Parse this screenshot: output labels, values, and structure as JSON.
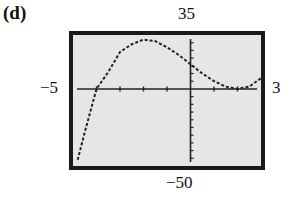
{
  "panel": {
    "label": "(d)"
  },
  "chart_data": {
    "type": "line",
    "title": "(d)",
    "xlabel": "",
    "ylabel": "",
    "xlim": [
      -5,
      3
    ],
    "ylim": [
      -50,
      35
    ],
    "tick_labels": {
      "xmin": "−5",
      "xmax": "3",
      "ymin": "−50",
      "ymax": "35"
    },
    "grid": false,
    "series": [
      {
        "name": "curve",
        "style": "dotted",
        "x": [
          -4.8,
          -4.5,
          -4,
          -3.5,
          -3,
          -2.5,
          -2,
          -1.5,
          -1,
          -0.5,
          0,
          0.5,
          1,
          1.5,
          2,
          2.5,
          3
        ],
        "y": [
          -46,
          -28,
          0,
          11,
          24,
          29,
          32,
          31,
          27,
          22,
          16,
          10,
          5,
          1.5,
          0,
          1.5,
          7
        ]
      }
    ],
    "x_ticks": [
      -4,
      -3,
      -2,
      -1,
      1,
      2
    ],
    "y_tick_spacing": 5
  }
}
